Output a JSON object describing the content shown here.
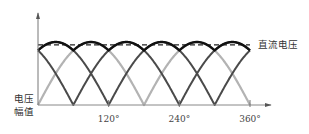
{
  "chart_data": {
    "type": "line",
    "title": "",
    "xlabel": "",
    "ylabel": "电压幅值",
    "ylabel_lines": [
      "电压",
      "幅值"
    ],
    "x_unit": "degrees",
    "xlim": [
      0,
      360
    ],
    "ylim": [
      0,
      1
    ],
    "grid": false,
    "x_ticks": [
      {
        "value": 120,
        "label": "120°"
      },
      {
        "value": 240,
        "label": "240°"
      },
      {
        "value": 360,
        "label": "360°"
      }
    ],
    "series": [
      {
        "name": "phase-a (rectified, light)",
        "formula": "|sin(x)|",
        "phase_deg": 0,
        "color": "#b3b3b3",
        "zeros_deg": [
          0,
          180,
          360
        ]
      },
      {
        "name": "phase-b (rectified, dark)",
        "formula": "|sin(x-60)|",
        "phase_deg": 60,
        "color": "#4a4a4a",
        "zeros_deg": [
          60,
          240
        ]
      },
      {
        "name": "phase-c (rectified, dark)",
        "formula": "|sin(x-120)|",
        "phase_deg": 120,
        "color": "#4a4a4a",
        "zeros_deg": [
          120,
          300
        ]
      },
      {
        "name": "envelope",
        "formula": "max of phases",
        "color": "#111111",
        "peak": 1.0,
        "trough": 0.866
      },
      {
        "name": "直流电压",
        "style": "dashed",
        "value": 0.955,
        "color": "#222222"
      }
    ],
    "annotations": [
      {
        "text": "直流电压",
        "target": "dashed DC line"
      }
    ]
  }
}
